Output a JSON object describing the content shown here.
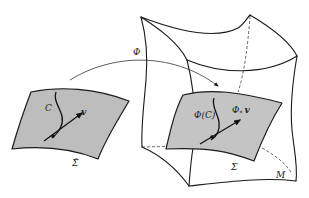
{
  "diagram": {
    "type": "manifold-map-illustration",
    "colors": {
      "surface_fill": "#bdbdbd",
      "stroke": "#1a1a1a",
      "background": "#ffffff"
    },
    "labels": {
      "map": "Φ",
      "curve": "C",
      "vector": "v",
      "source_surface": "Σ̃",
      "image_curve": "Φ(C)",
      "pushforward": "Φ",
      "pushforward_sub": "*",
      "pushforward_vector": "v",
      "target_surface": "Σ",
      "manifold": "M"
    }
  }
}
